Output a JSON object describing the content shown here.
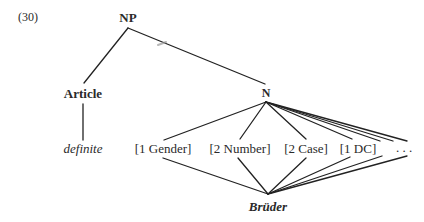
{
  "example_number": "(30)",
  "nodes": {
    "root": {
      "label": "NP",
      "x": 128,
      "y": 17
    },
    "article": {
      "label": "Article",
      "x": 83,
      "y": 93
    },
    "noun": {
      "label": "N",
      "x": 266,
      "y": 93
    },
    "definite": {
      "label": "definite",
      "x": 83,
      "y": 148
    },
    "gender": {
      "label": "[1 Gender]",
      "x": 163,
      "y": 148
    },
    "number": {
      "label": "[2 Number]",
      "x": 240,
      "y": 148
    },
    "case": {
      "label": "[2 Case]",
      "x": 306,
      "y": 148
    },
    "dc": {
      "label": "[1 DC]",
      "x": 358,
      "y": 148
    },
    "ellipsis": {
      "label": ". . .",
      "x": 404,
      "y": 148
    },
    "word": {
      "label": "Brüder",
      "x": 268,
      "y": 206
    }
  },
  "edges": [
    {
      "from": "NP",
      "to": "Article",
      "x1": 128,
      "y1": 28,
      "x2": 84,
      "y2": 83
    },
    {
      "from": "NP",
      "to": "N",
      "x1": 128,
      "y1": 28,
      "x2": 265,
      "y2": 84
    },
    {
      "from": "Article",
      "to": "definite",
      "x1": 83,
      "y1": 104,
      "x2": 83,
      "y2": 140
    },
    {
      "from": "N",
      "to": "[1 Gender]",
      "x1": 266,
      "y1": 102,
      "x2": 164,
      "y2": 140
    },
    {
      "from": "N",
      "to": "[2 Number]",
      "x1": 266,
      "y1": 102,
      "x2": 240,
      "y2": 139
    },
    {
      "from": "N",
      "to": "[2 Case]",
      "x1": 266,
      "y1": 102,
      "x2": 306,
      "y2": 139
    },
    {
      "from": "N",
      "to": "[1 DC]",
      "x1": 266,
      "y1": 102,
      "x2": 352,
      "y2": 139
    },
    {
      "from": "N",
      "to": "...",
      "x1": 266,
      "y1": 102,
      "x2": 380,
      "y2": 141
    },
    {
      "from": "N",
      "to": "...",
      "x1": 266,
      "y1": 102,
      "x2": 393,
      "y2": 141
    },
    {
      "from": "N",
      "to": "...",
      "x1": 266,
      "y1": 102,
      "x2": 407,
      "y2": 141
    },
    {
      "from": "[1 Gender]",
      "to": "Brüder",
      "x1": 163,
      "y1": 158,
      "x2": 268,
      "y2": 194
    },
    {
      "from": "[2 Number]",
      "to": "Brüder",
      "x1": 238,
      "y1": 158,
      "x2": 268,
      "y2": 194
    },
    {
      "from": "[2 Case]",
      "to": "Brüder",
      "x1": 306,
      "y1": 158,
      "x2": 268,
      "y2": 194
    },
    {
      "from": "[1 DC]",
      "to": "Brüder",
      "x1": 350,
      "y1": 157,
      "x2": 268,
      "y2": 194
    },
    {
      "from": "...",
      "to": "Brüder",
      "x1": 382,
      "y1": 156,
      "x2": 268,
      "y2": 194
    },
    {
      "from": "...",
      "to": "Brüder",
      "x1": 407,
      "y1": 156,
      "x2": 268,
      "y2": 194
    }
  ],
  "colors": {
    "line": "#222222",
    "text": "#2a2a2a",
    "smudge": "#9a9a9a",
    "background": "#ffffff"
  }
}
